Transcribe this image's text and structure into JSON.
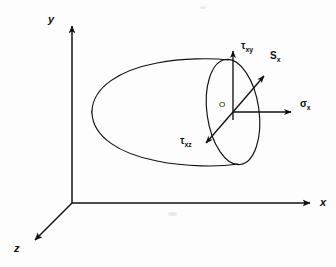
{
  "figure": {
    "kind": "3d-stress-vector-diagram",
    "background_color": "#fdfdfd",
    "stroke_color": "#101010",
    "axes": [
      {
        "id": "y",
        "label": "y",
        "label_x": 48,
        "label_y": 14,
        "from": [
          72,
          203
        ],
        "to": [
          72,
          20
        ]
      },
      {
        "id": "x",
        "label": "x",
        "label_x": 320,
        "label_y": 197,
        "from": [
          72,
          203
        ],
        "to": [
          316,
          203
        ]
      },
      {
        "id": "z",
        "label": "z",
        "label_x": 14,
        "label_y": 243,
        "from": [
          72,
          203
        ],
        "to": [
          31,
          244
        ]
      }
    ],
    "origin": {
      "label": "O",
      "label_x": 219,
      "label_y": 101,
      "point": [
        233,
        112
      ]
    },
    "vectors": [
      {
        "id": "tau-xy",
        "symbol": "τ",
        "subscript": "xy",
        "label_x": 241,
        "label_y": 41,
        "from": [
          233,
          120
        ],
        "to": [
          233,
          47
        ],
        "direction": "up"
      },
      {
        "id": "s-x",
        "symbol": "S",
        "subscript": "x",
        "label_x": 270,
        "label_y": 51,
        "from": [
          233,
          112
        ],
        "to": [
          268,
          72
        ],
        "direction": "up-right"
      },
      {
        "id": "sigma-x",
        "symbol": "σ",
        "subscript": "x",
        "label_x": 300,
        "label_y": 99,
        "from": [
          233,
          112
        ],
        "to": [
          296,
          112
        ],
        "direction": "right"
      },
      {
        "id": "tau-xz",
        "symbol": "τ",
        "subscript": "xz",
        "label_x": 180,
        "label_y": 136,
        "from": [
          233,
          112
        ],
        "to": [
          202,
          147
        ],
        "direction": "down-left"
      }
    ],
    "body": {
      "name": "oblique-cut-cone",
      "face_center": [
        233,
        112
      ],
      "face_rx": 26,
      "face_ry": 53,
      "face_rotation_deg": -8,
      "nose_x": 92
    }
  }
}
